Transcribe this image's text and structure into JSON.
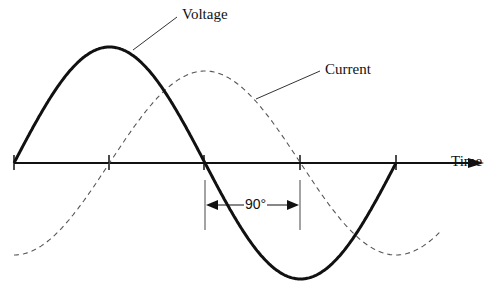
{
  "diagram": {
    "labels": {
      "voltage": "Voltage",
      "current": "Current",
      "time_axis": "Time",
      "phase_difference": "90°"
    },
    "colors": {
      "voltage_line": "#111111",
      "current_line": "#555555",
      "axis": "#111111",
      "background": "#ffffff"
    },
    "series": [
      {
        "name": "Voltage",
        "style": "solid-thick",
        "phase_deg": 0
      },
      {
        "name": "Current",
        "style": "dashed-thin",
        "phase_deg": -90
      }
    ]
  }
}
